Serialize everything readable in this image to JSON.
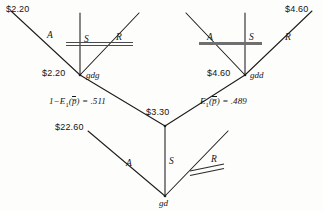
{
  "diagram": {
    "type": "decision-tree",
    "title": "",
    "ink_color": "#1c1c1c",
    "background_color": "#fdfdfc",
    "cut_mark_color": "#5a5a5a"
  },
  "terminal_values": {
    "top_left": "$2.20",
    "top_right": "$4.60",
    "left_node_value": "$2.20",
    "right_node_value": "$4.60",
    "center_node_value": "$3.30",
    "lower_left_value": "$22.60"
  },
  "nodes": [
    {
      "id": "gdg",
      "name": "gdg",
      "value": "$2.20"
    },
    {
      "id": "gdd",
      "name": "gdd",
      "value": "$4.60"
    },
    {
      "id": "gd",
      "name": "gd",
      "value": "$3.30"
    }
  ],
  "branches": {
    "left_node": [
      {
        "letter": "A",
        "pruned": false
      },
      {
        "letter": "S",
        "pruned": true
      },
      {
        "letter": "R",
        "pruned": true
      }
    ],
    "right_node": [
      {
        "letter": "A",
        "pruned": true
      },
      {
        "letter": "S",
        "pruned": true
      },
      {
        "letter": "R",
        "pruned": false
      }
    ],
    "bottom_node": [
      {
        "letter": "A",
        "pruned": false
      },
      {
        "letter": "S",
        "pruned": false
      },
      {
        "letter": "R",
        "pruned": true
      }
    ]
  },
  "probabilities": {
    "left": {
      "prefix": "1",
      "minus": "−",
      "func": "E",
      "sub": "1",
      "arg": "p̅",
      "equals": "= .511",
      "value": 0.511
    },
    "right": {
      "func": "E",
      "sub": "1",
      "arg": "p̅",
      "equals": "= .489",
      "value": 0.489
    }
  },
  "labels": {
    "letter_A": "A",
    "letter_S": "S",
    "letter_R": "R",
    "paren_open": "(",
    "paren_close": ")"
  }
}
